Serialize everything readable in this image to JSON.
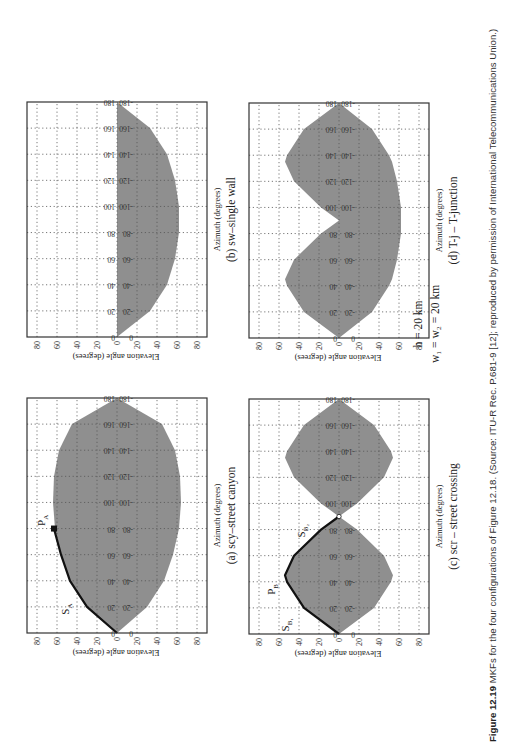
{
  "figure": {
    "number": "Figure 12.19",
    "caption": "MKFs for the four configurations of Figure 12.18. (Source: ITU-R Rec. P.681-9 [12]; reproduced by permission of International Telecommunications Union.)",
    "parameters": {
      "h": "h = 20 km",
      "w": "w₁ = w₂ = 20 km"
    },
    "orientation": "page rotated 90° counterclockwise"
  },
  "panels": [
    {
      "id": "a",
      "caption": "(a) scy–street canyon",
      "xlabel": "Azimuth (degrees)",
      "ylabel": "Elevation angle (degrees)",
      "annotations": [
        {
          "label": "S",
          "sub": "A"
        },
        {
          "label": "P",
          "sub": "A"
        }
      ]
    },
    {
      "id": "b",
      "caption": "(b) sw–single wall",
      "xlabel": "Azimuth (degrees)",
      "ylabel": "Elevation angle (degrees)",
      "annotations": []
    },
    {
      "id": "c",
      "caption": "(c) scr – street crossing",
      "xlabel": "Azimuth (degrees)",
      "ylabel": "Elevation angle (degrees)",
      "annotations": [
        {
          "label": "S",
          "sub": "B₁"
        },
        {
          "label": "P",
          "sub": "B"
        },
        {
          "label": "S",
          "sub": "B₂"
        }
      ]
    },
    {
      "id": "d",
      "caption": "(d) T-j – T-junction",
      "xlabel": "Azimuth (degrees)",
      "ylabel": "Elevation angle (degrees)",
      "annotations": []
    }
  ],
  "axis": {
    "y_ticks": [
      "80",
      "60",
      "40",
      "20",
      "0",
      "20",
      "40",
      "60",
      "80"
    ],
    "azimuth_ticks": [
      "0",
      "20",
      "40",
      "60",
      "80",
      "100",
      "120",
      "140",
      "160",
      "180"
    ]
  },
  "colors": {
    "fill": "#8f8f8f",
    "grid": "#555555",
    "frame": "#333333",
    "curve": "#111111"
  },
  "chart_data": [
    {
      "type": "area",
      "title": "(a) scy–street canyon",
      "xlabel": "Azimuth (degrees)",
      "ylabel": "Elevation angle (degrees)",
      "x": [
        0,
        20,
        40,
        60,
        80,
        100,
        120,
        140,
        160,
        180
      ],
      "upper": [
        0,
        30,
        47,
        56,
        62,
        64,
        63,
        58,
        45,
        0
      ],
      "lower": [
        0,
        -30,
        -47,
        -56,
        -62,
        -64,
        -63,
        -58,
        -45,
        0
      ],
      "highlight_curve": {
        "name": "S_A",
        "x": [
          0,
          20,
          40,
          60,
          80
        ],
        "y": [
          0,
          30,
          47,
          56,
          63
        ],
        "endpoint": "P_A"
      },
      "ylim": [
        -90,
        90
      ],
      "xlim": [
        0,
        180
      ],
      "grid": true
    },
    {
      "type": "area",
      "title": "(b) sw–single wall",
      "xlabel": "Azimuth (degrees)",
      "ylabel": "Elevation angle (degrees)",
      "x": [
        0,
        20,
        40,
        60,
        80,
        100,
        120,
        140,
        160,
        180
      ],
      "upper": [
        0,
        0,
        0,
        0,
        0,
        0,
        0,
        0,
        0,
        0
      ],
      "lower": [
        0,
        -33,
        -50,
        -58,
        -62,
        -62,
        -58,
        -50,
        -33,
        0
      ],
      "ylim": [
        -90,
        90
      ],
      "xlim": [
        0,
        180
      ],
      "grid": true
    },
    {
      "type": "area",
      "title": "(c) scr – street crossing",
      "xlabel": "Azimuth (degrees)",
      "ylabel": "Elevation angle (degrees)",
      "x": [
        0,
        20,
        40,
        45,
        60,
        80,
        90,
        100,
        120,
        135,
        140,
        160,
        180
      ],
      "upper": [
        0,
        35,
        52,
        54,
        45,
        18,
        0,
        18,
        45,
        54,
        52,
        35,
        0
      ],
      "lower": [
        0,
        -35,
        -52,
        -54,
        -45,
        -18,
        0,
        -18,
        -45,
        -54,
        -52,
        -35,
        0
      ],
      "highlight_curve": {
        "name": "S_B1 / S_B2",
        "x": [
          0,
          20,
          40,
          45,
          60,
          80,
          90
        ],
        "y": [
          0,
          35,
          52,
          54,
          45,
          18,
          0
        ],
        "peak": "P_B"
      },
      "ylim": [
        -90,
        90
      ],
      "xlim": [
        0,
        180
      ],
      "grid": true
    },
    {
      "type": "area",
      "title": "(d) T-j – T-junction",
      "xlabel": "Azimuth (degrees)",
      "ylabel": "Elevation angle (degrees)",
      "x": [
        0,
        20,
        40,
        45,
        60,
        80,
        90,
        100,
        120,
        135,
        140,
        160,
        180
      ],
      "upper": [
        0,
        35,
        52,
        54,
        45,
        18,
        0,
        18,
        45,
        54,
        52,
        35,
        0
      ],
      "lower": [
        0,
        -33,
        -50,
        -53,
        -58,
        -62,
        -62,
        -62,
        -58,
        -53,
        -50,
        -33,
        0
      ],
      "ylim": [
        -90,
        90
      ],
      "xlim": [
        0,
        180
      ],
      "grid": true
    }
  ]
}
